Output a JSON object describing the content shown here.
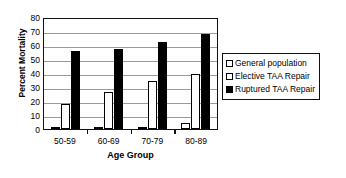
{
  "chart_data": {
    "type": "bar",
    "title": "",
    "xlabel": "Age Group",
    "ylabel": "Percent Mortality",
    "categories": [
      "50-59",
      "60-69",
      "70-79",
      "80-89"
    ],
    "series": [
      {
        "name": "General population",
        "values": [
          0.3,
          0.7,
          1.5,
          4
        ],
        "swatch": "hollow"
      },
      {
        "name": "Elective TAA Repair",
        "values": [
          18,
          26.5,
          34,
          39.5
        ],
        "swatch": "hollow"
      },
      {
        "name": "Ruptured TAA Repair",
        "values": [
          55.5,
          57,
          62,
          68
        ],
        "swatch": "filled"
      }
    ],
    "ylim": [
      0,
      80
    ],
    "yticks": [
      0,
      10,
      20,
      30,
      40,
      50,
      60,
      70,
      80
    ],
    "ytick_labels": [
      "0",
      "10",
      "20",
      "30",
      "40",
      "50",
      "60",
      "70",
      "80"
    ],
    "grid": true,
    "grid_axis": "y",
    "legend_position": "right",
    "colors": {
      "axis": "#111111",
      "gridline": "#9a9a9a",
      "bar_hollow_fill": "#ffffff",
      "bar_hollow_border": "#000000",
      "bar_filled": "#000000",
      "background": "#ffffff",
      "text": "#000000"
    }
  }
}
